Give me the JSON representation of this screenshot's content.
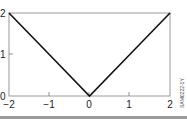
{
  "chart_data": {
    "type": "line",
    "title": "",
    "xlabel": "",
    "ylabel": "",
    "x": [
      -2,
      -1,
      0,
      1,
      2
    ],
    "series": [
      {
        "name": "|x|",
        "values": [
          2,
          1,
          0,
          1,
          2
        ]
      }
    ],
    "xlim": [
      -2,
      2
    ],
    "ylim": [
      0,
      2
    ],
    "xticks": [
      "-2",
      "-1",
      "0",
      "1",
      "2"
    ],
    "yticks": [
      "0",
      "1",
      "2"
    ],
    "grid": false,
    "legend": null,
    "annotations": [
      "SAM0222-1Y"
    ]
  },
  "labels": {
    "x": [
      "−2",
      "−1",
      "0",
      "1",
      "2"
    ],
    "y": [
      "0",
      "1",
      "2"
    ],
    "side": "SAM0222-1Y"
  }
}
